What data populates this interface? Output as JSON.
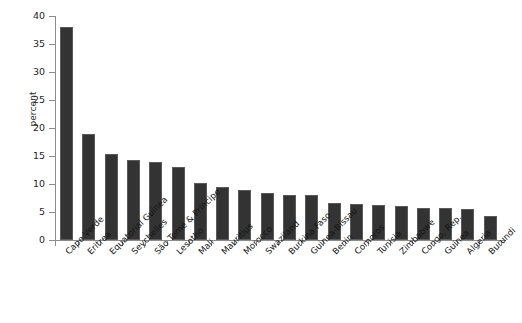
{
  "chart_data": {
    "type": "bar",
    "title": "",
    "subtitle": "",
    "xlabel": "",
    "ylabel": "percent",
    "ylim": [
      0,
      40
    ],
    "yticks": [
      0,
      5,
      10,
      15,
      20,
      25,
      30,
      35,
      40
    ],
    "ytick_labels": [
      "0",
      "5",
      "10",
      "15",
      "20",
      "25",
      "30",
      "35",
      "40"
    ],
    "grid": false,
    "legend": null,
    "bar_color": "#333333",
    "categories": [
      "Cape Verde",
      "Eritrea",
      "Equatorial Guinea",
      "Seychelles",
      "São Tomé & Príncipe",
      "Lesotho",
      "Mali",
      "Mauritius",
      "Morocco",
      "Swaziland",
      "Burkina Faso",
      "Guinea-Bissau",
      "Benin",
      "Comoros",
      "Tunisia",
      "Zimbabwe",
      "Congo, Rep.",
      "Guinea",
      "Algeria",
      "Burundi"
    ],
    "values": [
      38.0,
      19.0,
      15.3,
      14.3,
      14.0,
      13.0,
      10.2,
      9.5,
      9.0,
      8.4,
      8.0,
      8.0,
      6.6,
      6.5,
      6.3,
      6.1,
      5.8,
      5.7,
      5.6,
      4.3
    ]
  }
}
